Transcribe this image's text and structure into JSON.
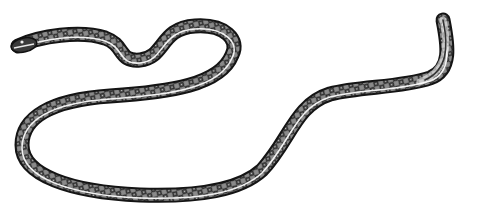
{
  "image": {
    "subject": "snake",
    "style": "black-and-white engraving illustration",
    "background": "#ffffff",
    "colors": {
      "outline": "#1a1a1a",
      "body_dark": "#2b2b2b",
      "body_mid": "#6a6a6a",
      "stripe": "#f2f2f2"
    },
    "body_path": "M 18 46 C 40 36, 80 30, 105 38 C 125 45, 118 62, 140 60 C 165 58, 160 28, 195 26 C 225 24, 240 40, 232 55 C 220 85, 170 92, 110 96 C 50 100, 22 118, 22 145 C 22 175, 70 192, 140 195 C 200 197, 240 190, 262 170 C 290 140, 295 105, 330 94 C 360 86, 400 88, 430 78 C 452 70, 448 45, 443 20",
    "tail_tip": {
      "x": 443,
      "y": 20
    },
    "head": {
      "x": 18,
      "y": 46
    }
  }
}
